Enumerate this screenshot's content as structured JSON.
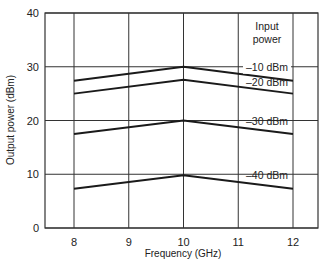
{
  "chart_data": {
    "type": "line",
    "title": "",
    "xlabel": "Frequency (GHz)",
    "ylabel": "Output power (dBm)",
    "xlim": [
      7.5,
      12.5
    ],
    "ylim": [
      0,
      40
    ],
    "x_ticks": [
      "8",
      "9",
      "10",
      "11",
      "12"
    ],
    "y_ticks": [
      "0",
      "10",
      "20",
      "30",
      "40"
    ],
    "grid": true,
    "legend_title": "Input power",
    "x": [
      8,
      10,
      12
    ],
    "series": [
      {
        "name": "-10 dBm",
        "label": "–10 dBm",
        "values": [
          27.4,
          30.0,
          27.4
        ]
      },
      {
        "name": "-20 dBm",
        "label": "–20 dBm",
        "values": [
          25.0,
          27.6,
          25.0
        ]
      },
      {
        "name": "-30 dBm",
        "label": "–30 dBm",
        "values": [
          17.5,
          20.0,
          17.5
        ]
      },
      {
        "name": "-40 dBm",
        "label": "–40 dBm",
        "values": [
          7.3,
          9.8,
          7.3
        ]
      }
    ],
    "colors": {
      "line": "#1a1a1a",
      "grid": "#333333",
      "background": "#ffffff"
    }
  }
}
